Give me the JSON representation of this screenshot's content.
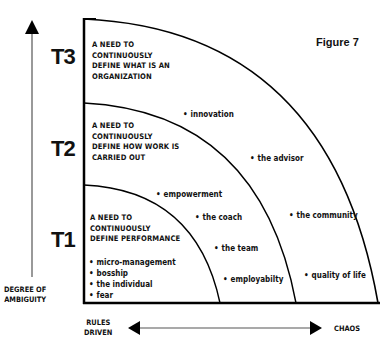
{
  "figure_label": "Figure 7",
  "tiers": [
    {
      "id": "T3",
      "label": "T3",
      "description": [
        "A NEED TO",
        "CONTINUOUSLY",
        "DEFINE WHAT IS AN",
        "ORGANIZATION"
      ]
    },
    {
      "id": "T2",
      "label": "T2",
      "description": [
        "A NEED TO",
        "CONTINUOUSLY",
        "DEFINE HOW WORK IS",
        "CARRIED OUT"
      ]
    },
    {
      "id": "T1",
      "label": "T1",
      "description": [
        "A NEED TO",
        "CONTINUOUSLY",
        "DEFINE PERFORMANCE"
      ]
    }
  ],
  "t1_items": [
    "micro-management",
    "bosship",
    "the individual",
    "fear"
  ],
  "scatter_items": {
    "innovation": "innovation",
    "empowerment": "empowerment",
    "the_coach": "the coach",
    "the_team": "the team",
    "employability": "employabilty",
    "the_advisor": "the advisor",
    "the_community": "the community",
    "quality_of_life": "quality of life"
  },
  "axes": {
    "y_label": [
      "DEGREE OF",
      "AMBIGUITY"
    ],
    "x_left_label": [
      "RULES",
      "DRIVEN"
    ],
    "x_right_label": "CHAOS"
  }
}
